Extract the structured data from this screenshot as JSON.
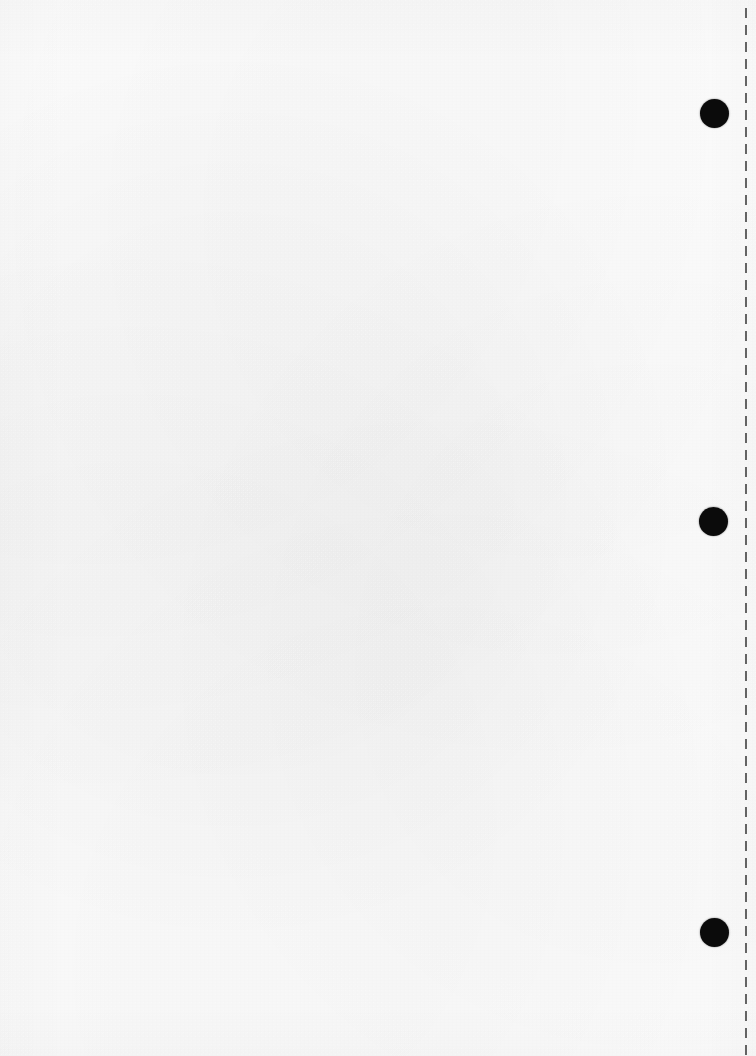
{
  "document": {
    "title": "Scanned blank page",
    "page_width": 756,
    "page_height": 1056,
    "background_color": "#fefefe",
    "body_text": "",
    "content_note": ""
  },
  "perforation": {
    "name": "perforation-dashed-line",
    "orientation": "vertical",
    "x": 746,
    "y_start": 8,
    "y_end": 1056,
    "dash_length": 10,
    "gap_length": 7,
    "thickness": 2,
    "color": "#3a3a3a"
  },
  "punch_marks": {
    "color": "#0b0b0b",
    "diameter": 29,
    "count": 3,
    "items": [
      {
        "label": "",
        "center_x": 714,
        "center_y": 113
      },
      {
        "label": "",
        "center_x": 713,
        "center_y": 521
      },
      {
        "label": "",
        "center_x": 714,
        "center_y": 932
      }
    ]
  }
}
